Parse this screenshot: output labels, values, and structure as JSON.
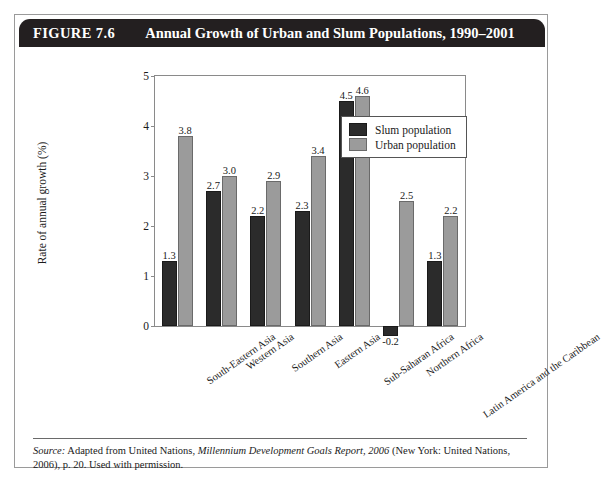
{
  "figure": {
    "number": "FIGURE 7.6",
    "title": "Annual Growth of Urban and Slum Populations, 1990–2001"
  },
  "source": {
    "label": "Source:",
    "text_before": " Adapted from United Nations, ",
    "italic_title": "Millennium Development Goals Report, 2006",
    "text_after": " (New York: United Nations, 2006), p. 20. Used with permission."
  },
  "legend": {
    "items": [
      {
        "label": "Slum population",
        "color": "#2b2b2b",
        "key": "slum"
      },
      {
        "label": "Urban population",
        "color": "#9b9b9b",
        "key": "urban"
      }
    ]
  },
  "chart_data": {
    "type": "bar",
    "title": "Annual Growth of Urban and Slum Populations, 1990–2001",
    "xlabel": "",
    "ylabel": "Rate of annual growth (%)",
    "ylim": [
      0,
      5
    ],
    "yticks": [
      0,
      1,
      2,
      3,
      4,
      5
    ],
    "ytick_labels": [
      "0",
      "1",
      "2",
      "3",
      "4",
      "5"
    ],
    "grid": false,
    "legend_position": "top-right-inside",
    "categories": [
      "South-Eastern Asia",
      "Western Asia",
      "Southern Asia",
      "Eastern Asia",
      "Sub-Saharan Africa",
      "Northern Africa",
      "Latin America and the Caribbean"
    ],
    "series": [
      {
        "name": "Slum population",
        "color": "#2b2b2b",
        "values": [
          1.3,
          2.7,
          2.2,
          2.3,
          4.5,
          -0.2,
          1.3
        ],
        "labels": [
          "1.3",
          "2.7",
          "2.2",
          "2.3",
          "4.5",
          "-0.2",
          "1.3"
        ]
      },
      {
        "name": "Urban population",
        "color": "#9b9b9b",
        "values": [
          3.8,
          3.0,
          2.9,
          3.4,
          4.6,
          2.5,
          2.2
        ],
        "labels": [
          "3.8",
          "3.0",
          "2.9",
          "3.4",
          "4.6",
          "2.5",
          "2.2"
        ]
      }
    ]
  }
}
